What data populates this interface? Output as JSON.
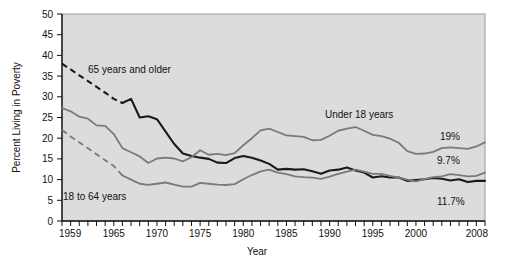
{
  "chart_data": {
    "type": "line",
    "title": "",
    "xlabel": "Year",
    "ylabel": "Percent Living in Poverty",
    "xlim": [
      1959,
      2008
    ],
    "ylim": [
      0,
      50
    ],
    "yticks": [
      0,
      5,
      10,
      15,
      20,
      25,
      30,
      35,
      40,
      45,
      50
    ],
    "xticks_major": [
      1959,
      1965,
      1970,
      1975,
      1980,
      1985,
      1990,
      1995,
      2000,
      2008
    ],
    "xtick_minor_step": 1,
    "grid": false,
    "legend_position": "inline-annotations",
    "plot_background": "#dcdcdc",
    "x": [
      1959,
      1960,
      1961,
      1962,
      1963,
      1964,
      1965,
      1966,
      1967,
      1968,
      1969,
      1970,
      1971,
      1972,
      1973,
      1974,
      1975,
      1976,
      1977,
      1978,
      1979,
      1980,
      1981,
      1982,
      1983,
      1984,
      1985,
      1986,
      1987,
      1988,
      1989,
      1990,
      1991,
      1992,
      1993,
      1994,
      1995,
      1996,
      1997,
      1998,
      1999,
      2000,
      2001,
      2002,
      2003,
      2004,
      2005,
      2006,
      2007,
      2008
    ],
    "series": [
      {
        "name": "65 years and older",
        "color": "#1a1a1a",
        "end_label": "9.7%",
        "dashed_through": 1966,
        "values": [
          38.0,
          36.6,
          35.2,
          33.8,
          32.4,
          31.0,
          29.5,
          28.5,
          29.5,
          25.0,
          25.3,
          24.6,
          21.6,
          18.6,
          16.3,
          15.7,
          15.3,
          15.0,
          14.1,
          14.0,
          15.2,
          15.7,
          15.3,
          14.6,
          13.8,
          12.4,
          12.6,
          12.4,
          12.5,
          12.0,
          11.4,
          12.2,
          12.4,
          12.9,
          12.2,
          11.7,
          10.5,
          10.8,
          10.5,
          10.5,
          9.7,
          9.9,
          10.1,
          10.4,
          10.2,
          9.8,
          10.1,
          9.4,
          9.7,
          9.7
        ]
      },
      {
        "name": "Under 18 years",
        "color": "#7a7a7a",
        "end_label": "19%",
        "dashed_through": null,
        "values": [
          27.3,
          26.5,
          25.2,
          24.7,
          23.1,
          23.0,
          21.0,
          17.6,
          16.6,
          15.6,
          14.0,
          15.1,
          15.3,
          15.1,
          14.4,
          15.4,
          17.1,
          16.0,
          16.2,
          15.9,
          16.4,
          18.3,
          20.0,
          21.9,
          22.3,
          21.5,
          20.7,
          20.5,
          20.3,
          19.5,
          19.6,
          20.6,
          21.8,
          22.3,
          22.7,
          21.8,
          20.8,
          20.5,
          19.9,
          18.9,
          16.9,
          16.2,
          16.3,
          16.7,
          17.6,
          17.8,
          17.6,
          17.4,
          18.0,
          19.0
        ]
      },
      {
        "name": "18 to 64 years",
        "color": "#7a7a7a",
        "end_label": "11.7%",
        "dashed_through": 1966,
        "values": [
          22.0,
          20.4,
          19.0,
          17.6,
          16.1,
          14.7,
          13.3,
          11.0,
          10.0,
          9.0,
          8.7,
          9.0,
          9.3,
          8.8,
          8.3,
          8.3,
          9.2,
          9.0,
          8.8,
          8.7,
          8.9,
          10.1,
          11.1,
          12.0,
          12.4,
          11.7,
          11.3,
          10.8,
          10.6,
          10.5,
          10.2,
          10.7,
          11.4,
          11.9,
          12.4,
          11.9,
          11.4,
          11.4,
          10.9,
          10.5,
          10.0,
          9.6,
          10.1,
          10.6,
          10.8,
          11.3,
          11.1,
          10.8,
          10.9,
          11.7
        ]
      }
    ],
    "annotations": [
      {
        "text": "65 years and older",
        "x_px": 88,
        "y_px": 73
      },
      {
        "text": "Under 18 years",
        "x_px": 325,
        "y_px": 118
      },
      {
        "text": "18 to 64 years",
        "x_px": 63,
        "y_px": 200
      }
    ]
  }
}
